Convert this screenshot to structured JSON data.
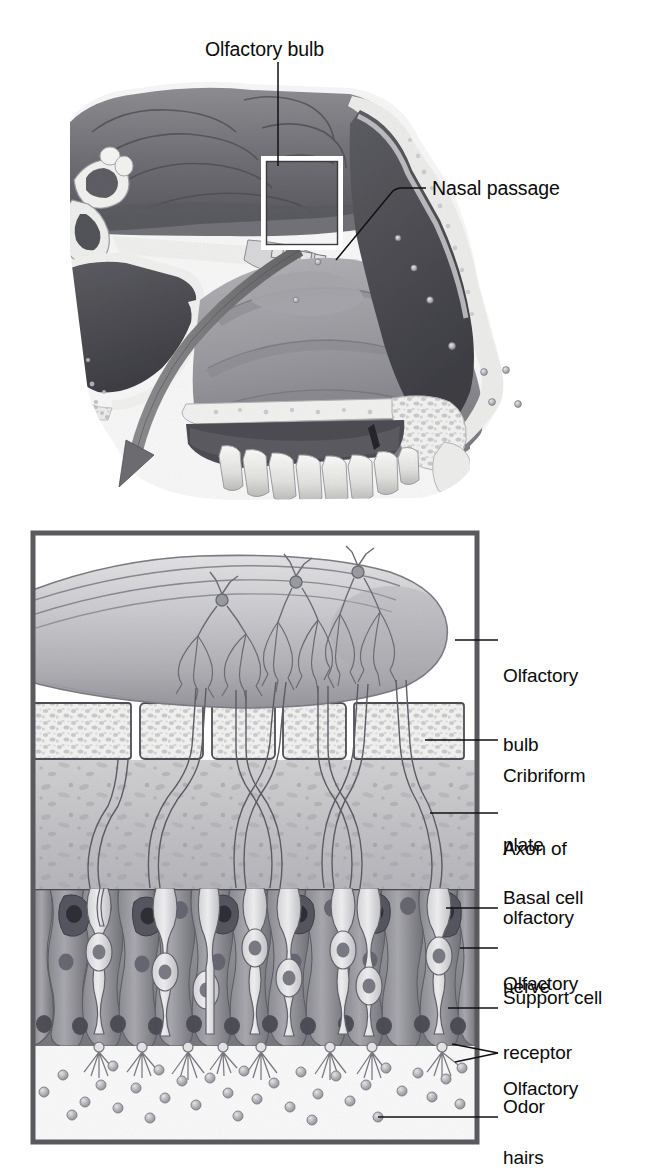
{
  "figure": {
    "panels": {
      "top": {
        "name": "sagittal-head-section",
        "description": "Midsagittal section of the nasal cavity showing olfactory bulb and nasal passage",
        "labels": [
          {
            "id": "olfactory-bulb-top",
            "text": "Olfactory bulb",
            "x": 205,
            "y": 38,
            "leader": "vertical down from text to callout box"
          },
          {
            "id": "nasal-passage-top",
            "text": "Nasal passage",
            "x": 432,
            "y": 180,
            "leader": "horizontal then diagonal down-left into nasal cavity"
          }
        ],
        "callout_box": {
          "name": "magnification-region",
          "x": 264,
          "y": 159,
          "width": 76,
          "height": 88
        },
        "airflow_arrow": {
          "name": "airflow-arrow",
          "description": "Curved arrow sweeping from nasal cavity down and out to the lower panel",
          "color": "#6f6f70"
        }
      },
      "bottom": {
        "name": "olfactory-epithelium-detail",
        "description": "Magnified view of the olfactory bulb, cribriform plate and olfactory epithelium",
        "frame": {
          "x": 30,
          "y": 530,
          "width": 450,
          "height": 615,
          "border_color": "#5a5a5e",
          "border_width": 5
        },
        "labels": [
          {
            "id": "olfactory-bulb",
            "text": "Olfactory\nbulb",
            "line1": "Olfactory",
            "line2": "bulb",
            "x": 503,
            "y": 628,
            "leader_y": 640,
            "leader_from_x": 455
          },
          {
            "id": "cribriform-plate",
            "text": "Cribriform\nplate",
            "line1": "Cribriform",
            "line2": "plate",
            "x": 503,
            "y": 726,
            "leader_y": 740,
            "leader_from_x": 425
          },
          {
            "id": "axon-of-olfactory-nerve",
            "text": "Axon of\nolfactory\nnerve",
            "line1": "Axon of",
            "line2": "olfactory",
            "line3": "nerve",
            "x": 503,
            "y": 800,
            "leader_y": 813,
            "leader_from_x": 430
          },
          {
            "id": "basal-cell",
            "text": "Basal cell",
            "line1": "Basal cell",
            "x": 503,
            "y": 896,
            "leader_y": 908,
            "leader_from_x": 446
          },
          {
            "id": "olfactory-receptor",
            "text": "Olfactory\nreceptor",
            "line1": "Olfactory",
            "line2": "receptor",
            "x": 503,
            "y": 936,
            "leader_y": 948,
            "leader_from_x": 460
          },
          {
            "id": "support-cell",
            "text": "Support cell",
            "line1": "Support cell",
            "x": 503,
            "y": 996,
            "leader_y": 1008,
            "leader_from_x": 448
          },
          {
            "id": "olfactory-hairs",
            "text": "Olfactory\nhairs",
            "line1": "Olfactory",
            "line2": "hairs",
            "x": 503,
            "y": 1041,
            "leader_y": 1053,
            "leader_from_x": 452
          },
          {
            "id": "odor",
            "text": "Odor",
            "line1": "Odor",
            "x": 503,
            "y": 1105,
            "leader_y": 1117,
            "leader_from_x": 378
          }
        ],
        "layers": [
          {
            "id": "olfactory-bulb-layer",
            "label": "Olfactory bulb",
            "top": 545,
            "bottom": 700
          },
          {
            "id": "cribriform-plate-layer",
            "label": "Cribriform plate",
            "top": 700,
            "bottom": 760
          },
          {
            "id": "lamina-propria-layer",
            "label": "Axon of olfactory nerve",
            "top": 760,
            "bottom": 890
          },
          {
            "id": "epithelium-layer",
            "label": "Olfactory epithelium",
            "top": 890,
            "bottom": 1045
          },
          {
            "id": "mucus-layer",
            "label": "Mucus with odor molecules",
            "top": 1045,
            "bottom": 1140
          }
        ],
        "counts": {
          "mitral_cells": 3,
          "cribriform_bone_blocks": 5,
          "receptor_neurons": 8,
          "odor_molecules": 34
        }
      }
    },
    "palette": {
      "ink": "#0b0b0b",
      "frame": "#5a5a5e",
      "bulb_light": "#d8d8da",
      "bulb_mid": "#bcbcc0",
      "bulb_dark": "#9a9a9f",
      "bone_light": "#f2f2f0",
      "bone_speckle": "#c9c9cc",
      "tissue_mid": "#c4c4c6",
      "epithelium": "#a0a0a4",
      "epithelium_dark": "#6e6e74",
      "odor": "#b9b9bd",
      "arrow": "#6f6f70",
      "background": "#ffffff"
    }
  }
}
